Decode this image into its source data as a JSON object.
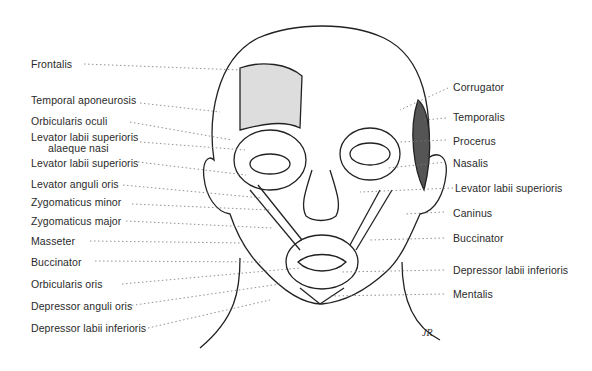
{
  "diagram": {
    "left_labels": [
      {
        "id": "frontalis",
        "text": "Frontalis"
      },
      {
        "id": "temporal-aponeurosis",
        "text": "Temporal aponeurosis"
      },
      {
        "id": "orbicularis-oculi",
        "text": "Orbicularis oculi"
      },
      {
        "id": "levator-labii-superioris-alaeque-nasi",
        "text": "Levator labii superioris",
        "text2": "alaeque nasi"
      },
      {
        "id": "levator-labii-superioris-left",
        "text": "Levator labii superioris"
      },
      {
        "id": "levator-anguli-oris",
        "text": "Levator anguli oris"
      },
      {
        "id": "zygomaticus-minor",
        "text": "Zygomaticus minor"
      },
      {
        "id": "zygomaticus-major",
        "text": "Zygomaticus major"
      },
      {
        "id": "masseter",
        "text": "Masseter"
      },
      {
        "id": "buccinator-left",
        "text": "Buccinator"
      },
      {
        "id": "orbicularis-oris",
        "text": "Orbicularis oris"
      },
      {
        "id": "depressor-anguli-oris",
        "text": "Depressor anguli oris"
      },
      {
        "id": "depressor-labii-inferioris-left",
        "text": "Depressor labii inferioris"
      }
    ],
    "right_labels": [
      {
        "id": "corrugator",
        "text": "Corrugator"
      },
      {
        "id": "temporalis",
        "text": "Temporalis"
      },
      {
        "id": "procerus",
        "text": "Procerus"
      },
      {
        "id": "nasalis",
        "text": "Nasalis"
      },
      {
        "id": "levator-labii-superioris-right",
        "text": "Levator labii superioris"
      },
      {
        "id": "caninus",
        "text": "Caninus"
      },
      {
        "id": "buccinator-right",
        "text": "Buccinator"
      },
      {
        "id": "depressor-labii-inferioris-right",
        "text": "Depressor labii inferioris"
      },
      {
        "id": "mentalis",
        "text": "Mentalis"
      }
    ],
    "signature": "JR"
  }
}
